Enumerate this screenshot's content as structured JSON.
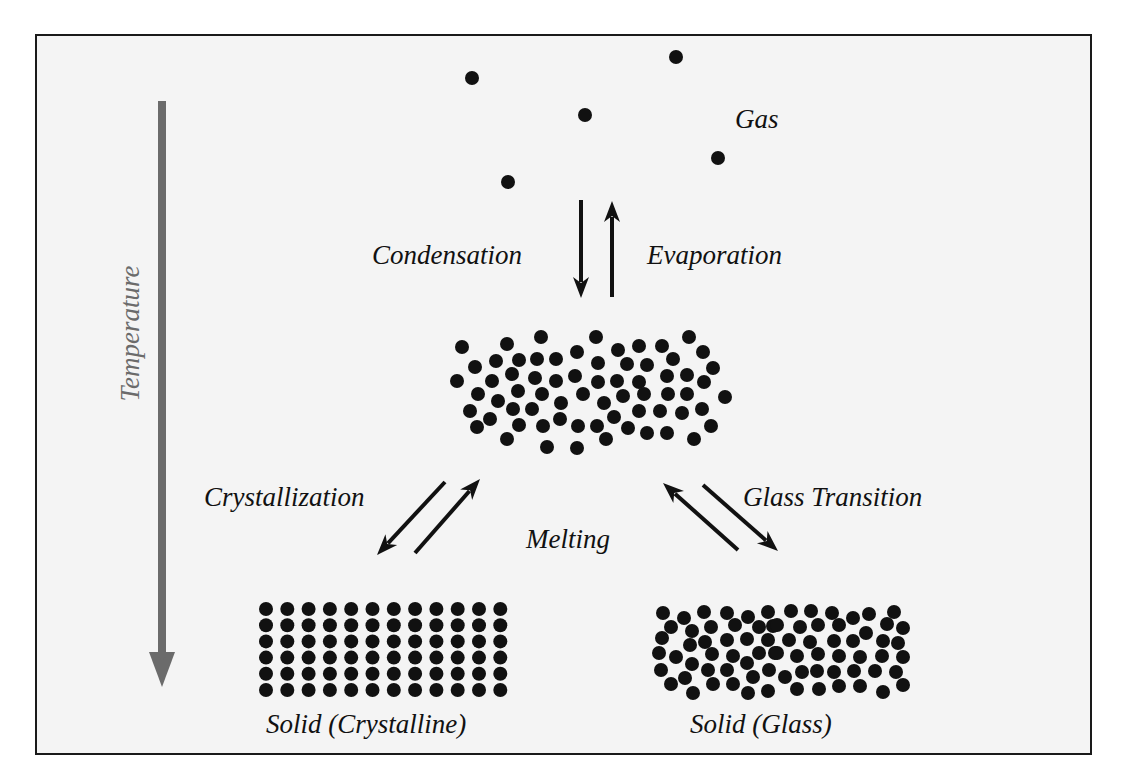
{
  "figure": {
    "colors": {
      "background": "#f4f4f4",
      "frame": "#1a1a1a",
      "particle": "#111111",
      "arrow": "#111111",
      "temperature_arrow": "#6b6b6b"
    }
  },
  "axis": {
    "label": "Temperature",
    "direction": "down"
  },
  "states": {
    "gas": {
      "label": "Gas"
    },
    "liquid": {
      "label": ""
    },
    "crystalline": {
      "label": "Solid (Crystalline)"
    },
    "glass": {
      "label": "Solid (Glass)"
    }
  },
  "transitions": {
    "condensation": "Condensation",
    "evaporation": "Evaporation",
    "crystallization": "Crystallization",
    "melting": "Melting",
    "glass_transition": "Glass Transition"
  },
  "particles": {
    "radius": 7,
    "gas": [
      [
        472,
        78
      ],
      [
        508,
        182
      ],
      [
        585,
        115
      ],
      [
        676,
        57
      ],
      [
        718,
        158
      ]
    ],
    "liquid": [
      [
        462,
        347
      ],
      [
        507,
        344
      ],
      [
        541,
        337
      ],
      [
        596,
        337
      ],
      [
        689,
        337
      ],
      [
        618,
        350
      ],
      [
        639,
        346
      ],
      [
        662,
        346
      ],
      [
        703,
        352
      ],
      [
        475,
        367
      ],
      [
        496,
        361
      ],
      [
        519,
        360
      ],
      [
        537,
        359
      ],
      [
        556,
        359
      ],
      [
        577,
        352
      ],
      [
        598,
        363
      ],
      [
        627,
        364
      ],
      [
        647,
        365
      ],
      [
        673,
        359
      ],
      [
        713,
        368
      ],
      [
        457,
        381
      ],
      [
        492,
        381
      ],
      [
        512,
        374
      ],
      [
        535,
        378
      ],
      [
        556,
        381
      ],
      [
        575,
        376
      ],
      [
        598,
        382
      ],
      [
        617,
        381
      ],
      [
        639,
        382
      ],
      [
        667,
        376
      ],
      [
        687,
        375
      ],
      [
        704,
        382
      ],
      [
        478,
        394
      ],
      [
        518,
        391
      ],
      [
        542,
        394
      ],
      [
        583,
        394
      ],
      [
        623,
        396
      ],
      [
        644,
        394
      ],
      [
        668,
        394
      ],
      [
        687,
        394
      ],
      [
        725,
        397
      ],
      [
        498,
        401
      ],
      [
        561,
        403
      ],
      [
        604,
        403
      ],
      [
        470,
        411
      ],
      [
        513,
        409
      ],
      [
        532,
        409
      ],
      [
        639,
        411
      ],
      [
        660,
        411
      ],
      [
        682,
        413
      ],
      [
        702,
        409
      ],
      [
        490,
        419
      ],
      [
        560,
        419
      ],
      [
        614,
        417
      ],
      [
        477,
        427
      ],
      [
        519,
        425
      ],
      [
        543,
        426
      ],
      [
        578,
        426
      ],
      [
        597,
        426
      ],
      [
        628,
        428
      ],
      [
        647,
        433
      ],
      [
        667,
        433
      ],
      [
        711,
        426
      ],
      [
        507,
        439
      ],
      [
        547,
        447
      ],
      [
        577,
        448
      ],
      [
        606,
        439
      ],
      [
        694,
        439
      ]
    ],
    "crystal_grid": {
      "x0": 266,
      "y0": 609,
      "cols": 12,
      "rows": 6,
      "dx": 21.3,
      "dy": 16.2
    },
    "glass": [
      [
        663,
        613
      ],
      [
        684,
        618
      ],
      [
        704,
        612
      ],
      [
        727,
        613
      ],
      [
        748,
        617
      ],
      [
        768,
        612
      ],
      [
        671,
        627
      ],
      [
        692,
        631
      ],
      [
        711,
        627
      ],
      [
        735,
        625
      ],
      [
        759,
        627
      ],
      [
        773,
        626
      ],
      [
        662,
        638
      ],
      [
        690,
        645
      ],
      [
        705,
        642
      ],
      [
        727,
        640
      ],
      [
        747,
        639
      ],
      [
        768,
        640
      ],
      [
        659,
        653
      ],
      [
        676,
        657
      ],
      [
        712,
        654
      ],
      [
        733,
        656
      ],
      [
        759,
        653
      ],
      [
        775,
        653
      ],
      [
        692,
        664
      ],
      [
        747,
        663
      ],
      [
        661,
        670
      ],
      [
        708,
        670
      ],
      [
        727,
        670
      ],
      [
        769,
        670
      ],
      [
        685,
        678
      ],
      [
        753,
        677
      ],
      [
        671,
        684
      ],
      [
        713,
        684
      ],
      [
        733,
        684
      ],
      [
        693,
        693
      ],
      [
        748,
        693
      ],
      [
        768,
        691
      ],
      [
        791,
        611
      ],
      [
        811,
        611
      ],
      [
        832,
        613
      ],
      [
        853,
        618
      ],
      [
        869,
        614
      ],
      [
        894,
        612
      ],
      [
        777,
        625
      ],
      [
        800,
        627
      ],
      [
        818,
        625
      ],
      [
        839,
        625
      ],
      [
        866,
        633
      ],
      [
        887,
        624
      ],
      [
        903,
        628
      ],
      [
        789,
        640
      ],
      [
        810,
        642
      ],
      [
        834,
        641
      ],
      [
        853,
        641
      ],
      [
        883,
        641
      ],
      [
        898,
        643
      ],
      [
        777,
        653
      ],
      [
        797,
        656
      ],
      [
        818,
        654
      ],
      [
        839,
        656
      ],
      [
        860,
        657
      ],
      [
        882,
        656
      ],
      [
        903,
        657
      ],
      [
        802,
        672
      ],
      [
        817,
        671
      ],
      [
        834,
        672
      ],
      [
        854,
        671
      ],
      [
        875,
        671
      ],
      [
        896,
        672
      ],
      [
        785,
        677
      ],
      [
        797,
        689
      ],
      [
        819,
        689
      ],
      [
        839,
        686
      ],
      [
        860,
        686
      ],
      [
        883,
        692
      ],
      [
        903,
        685
      ]
    ]
  },
  "arrows": [
    {
      "name": "condensation-arrow",
      "from": [
        581,
        200
      ],
      "to": [
        581,
        298
      ]
    },
    {
      "name": "evaporation-arrow",
      "from": [
        612,
        297
      ],
      "to": [
        612,
        201
      ]
    },
    {
      "name": "crystallization-arrow",
      "from": [
        445,
        482
      ],
      "to": [
        377,
        555
      ]
    },
    {
      "name": "melting-from-crystal-arrow",
      "from": [
        415,
        553
      ],
      "to": [
        480,
        479
      ]
    },
    {
      "name": "melting-from-glass-arrow",
      "from": [
        738,
        550
      ],
      "to": [
        663,
        483
      ]
    },
    {
      "name": "glass-transition-arrow",
      "from": [
        703,
        485
      ],
      "to": [
        778,
        551
      ]
    }
  ]
}
